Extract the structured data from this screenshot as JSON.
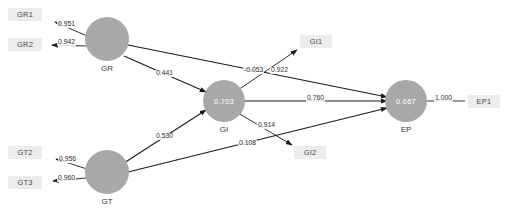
{
  "diagram": {
    "colors": {
      "construct_fill": "#a8a8a8",
      "indicator_fill": "#ececec",
      "edge": "#1a1a1a",
      "text": "#2e2e2e",
      "value_text": "#ffffff"
    },
    "constructs": [
      {
        "id": "GR",
        "label": "GR",
        "value": ""
      },
      {
        "id": "GT",
        "label": "GT",
        "value": ""
      },
      {
        "id": "GI",
        "label": "GI",
        "value": "0.703"
      },
      {
        "id": "EP",
        "label": "EP",
        "value": "0.667"
      }
    ],
    "indicators": [
      {
        "id": "GR1",
        "label": "GR1"
      },
      {
        "id": "GR2",
        "label": "GR2"
      },
      {
        "id": "GT2",
        "label": "GT2"
      },
      {
        "id": "GT3",
        "label": "GT3"
      },
      {
        "id": "GI1",
        "label": "GI1"
      },
      {
        "id": "GI2",
        "label": "GI2"
      },
      {
        "id": "EP1",
        "label": "EP1"
      }
    ],
    "loadings": [
      {
        "from": "GR",
        "to": "GR1",
        "value": "0.951"
      },
      {
        "from": "GR",
        "to": "GR2",
        "value": "0.942"
      },
      {
        "from": "GT",
        "to": "GT2",
        "value": "0.956"
      },
      {
        "from": "GT",
        "to": "GT3",
        "value": "0.960"
      },
      {
        "from": "GI",
        "to": "GI1",
        "value": "0.922"
      },
      {
        "from": "GI",
        "to": "GI2",
        "value": "0.914"
      },
      {
        "from": "EP",
        "to": "EP1",
        "value": "1.000"
      }
    ],
    "paths": [
      {
        "from": "GR",
        "to": "GI",
        "value": "0.441"
      },
      {
        "from": "GT",
        "to": "GI",
        "value": "0.530"
      },
      {
        "from": "GR",
        "to": "EP",
        "value": "-0.053"
      },
      {
        "from": "GI",
        "to": "EP",
        "value": "0.760"
      },
      {
        "from": "GT",
        "to": "EP",
        "value": "0.108"
      }
    ]
  }
}
